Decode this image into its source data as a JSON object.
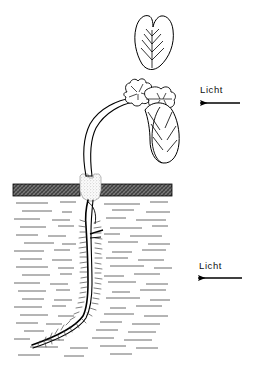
{
  "figure": {
    "background_color": "#ffffff",
    "ink_color": "#000000"
  },
  "labels": {
    "light_top": {
      "text": "Licht",
      "arrow_direction": "left",
      "arrow_color": "#000000"
    },
    "light_bottom": {
      "text": "Licht",
      "arrow_direction": "left",
      "arrow_color": "#000000"
    }
  },
  "scene": {
    "cover": {
      "name": "dunkle Abdeckung",
      "fill_color": "#4a4a4a",
      "edge_color": "#000000"
    },
    "plug": {
      "name": "Korkstopfen",
      "fill_color": "#f2f2f2",
      "stipple_color": "#8a8a8a"
    },
    "water": {
      "name": "Wasser",
      "dash_color": "#555555"
    },
    "shoot": {
      "name": "Spross mit Haken",
      "stroke_color": "#000000"
    },
    "root": {
      "name": "Wurzel mit Wurzelhaaren",
      "stroke_color": "#000000"
    },
    "leaves": {
      "count": 3,
      "stroke_color": "#000000"
    }
  }
}
